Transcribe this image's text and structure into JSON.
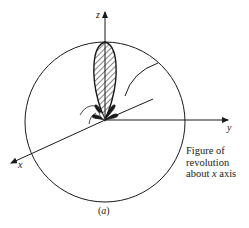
{
  "figure": {
    "axes": {
      "z_label": "z",
      "y_label": "y",
      "x_label": "x"
    },
    "annotation": {
      "line1": "Figure of",
      "line2": "revolution",
      "line3_prefix": "about ",
      "line3_var": "x",
      "line3_suffix": " axis"
    },
    "caption": {
      "open": "(",
      "label": "a",
      "close": ")"
    },
    "colors": {
      "stroke": "#1a1a1a",
      "background": "#ffffff"
    }
  }
}
